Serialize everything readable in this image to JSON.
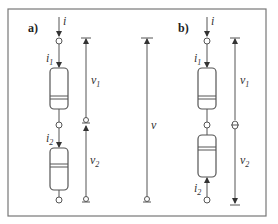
{
  "diagram": {
    "panels": [
      {
        "id": "a",
        "label": "a)",
        "current_in": "i",
        "current_1": {
          "base": "i",
          "sub": "1"
        },
        "current_2": {
          "base": "i",
          "sub": "2"
        },
        "voltage_1": {
          "base": "v",
          "sub": "1"
        },
        "voltage_2": {
          "base": "v",
          "sub": "2"
        }
      },
      {
        "id": "b",
        "label": "b)",
        "current_in": "i",
        "current_1": {
          "base": "i",
          "sub": "1"
        },
        "current_2": {
          "base": "i",
          "sub": "2"
        },
        "voltage_1": {
          "base": "v",
          "sub": "1"
        },
        "voltage_2": {
          "base": "v",
          "sub": "2"
        }
      }
    ],
    "total_voltage": "v"
  }
}
